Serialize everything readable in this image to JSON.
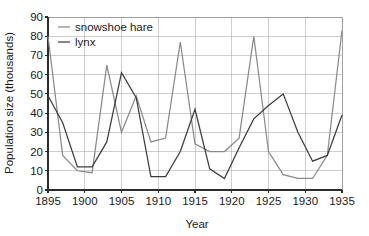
{
  "chart_data": {
    "type": "line",
    "title": "",
    "xlabel": "Year",
    "ylabel": "Population size (thousands)",
    "xlim": [
      1895,
      1935
    ],
    "ylim": [
      0,
      90
    ],
    "grid": true,
    "legend_position": "top-left",
    "x_ticks": [
      1895,
      1900,
      1905,
      1910,
      1915,
      1920,
      1925,
      1930,
      1935
    ],
    "x_tick_labels": [
      "1895",
      "1900",
      "1905",
      "1910",
      "1915",
      "1920",
      "1925",
      "1930",
      "1935"
    ],
    "y_ticks": [
      0,
      10,
      20,
      30,
      40,
      50,
      60,
      70,
      80,
      90
    ],
    "y_tick_labels": [
      "0",
      "10",
      "20",
      "30",
      "40",
      "50",
      "60",
      "70",
      "80",
      "90"
    ],
    "x": [
      1895,
      1897,
      1899,
      1901,
      1903,
      1905,
      1907,
      1909,
      1911,
      1913,
      1915,
      1917,
      1919,
      1921,
      1923,
      1925,
      1927,
      1929,
      1931,
      1933,
      1935
    ],
    "series": [
      {
        "name": "snowshoe hare",
        "color": "#8a8a8a",
        "values": [
          80,
          18,
          10,
          9,
          65,
          30,
          49,
          25,
          27,
          77,
          24,
          20,
          20,
          27,
          80,
          20,
          8,
          6,
          6,
          18,
          83
        ]
      },
      {
        "name": "lynx",
        "color": "#3d3d3d",
        "values": [
          49,
          35,
          12,
          12,
          25,
          61,
          48,
          7,
          7,
          20,
          42,
          11,
          6,
          22,
          37,
          44,
          50,
          30,
          15,
          18,
          39
        ]
      }
    ]
  },
  "legend": {
    "entries": [
      {
        "label": "snowshoe hare",
        "color": "#8a8a8a",
        "marker": "line-swatch"
      },
      {
        "label": "lynx",
        "color": "#3d3d3d",
        "marker": "line-swatch"
      }
    ]
  },
  "axes": {
    "x_title": "Year",
    "y_title": "Population size (thousands)"
  }
}
